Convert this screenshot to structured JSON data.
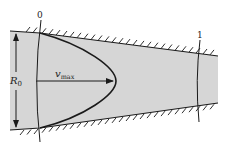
{
  "diagram": {
    "title": "",
    "labels": {
      "section_0": "0",
      "section_1": "1",
      "radius_main": "R",
      "radius_sub": "0",
      "velocity_main": "v",
      "velocity_sub": "max"
    },
    "colors": {
      "fluid_fill": "#d6d6d6",
      "line": "#1a1a1a",
      "background": "#ffffff"
    }
  }
}
